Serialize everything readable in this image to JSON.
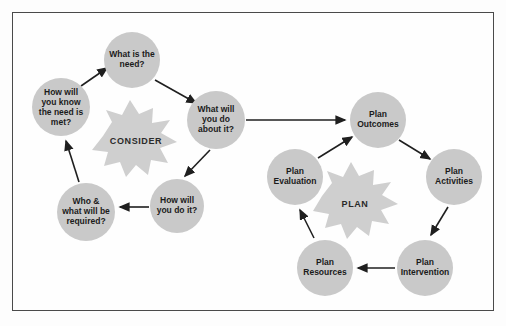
{
  "diagram": {
    "background_color": "#fdfdfd",
    "frame_color": "#4a4a4a",
    "node_fill": "#c9c9c9",
    "burst_fill": "#cfcfcf",
    "arrow_color": "#1f1f1f",
    "text_color": "#1b1b1b"
  },
  "consider_cycle": {
    "burst_label": "CONSIDER",
    "nodes": [
      {
        "id": "what-is-the-need",
        "lines": [
          "What is the",
          "need?"
        ],
        "cx": 132,
        "cy": 60,
        "r": 28
      },
      {
        "id": "what-will-you-do-about-it",
        "lines": [
          "What will",
          "you do",
          "about it?"
        ],
        "cx": 216,
        "cy": 120,
        "r": 29
      },
      {
        "id": "how-will-you-do-it",
        "lines": [
          "How will",
          "you do it?"
        ],
        "cx": 177,
        "cy": 206,
        "r": 27
      },
      {
        "id": "who-and-what-will-be-required",
        "lines": [
          "Who &",
          "what will be",
          "required?"
        ],
        "cx": 86,
        "cy": 212,
        "r": 29
      },
      {
        "id": "how-will-you-know-the-need-is-met",
        "lines": [
          "How will",
          "you know",
          "the need is",
          "met?"
        ],
        "cx": 61,
        "cy": 107,
        "r": 29
      }
    ],
    "arrows": [
      {
        "from": "how-will-you-know-the-need-is-met",
        "to": "what-is-the-need"
      },
      {
        "from": "what-is-the-need",
        "to": "what-will-you-do-about-it"
      },
      {
        "from": "what-will-you-do-about-it",
        "to": "how-will-you-do-it"
      },
      {
        "from": "how-will-you-do-it",
        "to": "who-and-what-will-be-required"
      },
      {
        "from": "who-and-what-will-be-required",
        "to": "how-will-you-know-the-need-is-met"
      }
    ]
  },
  "plan_cycle": {
    "burst_label": "PLAN",
    "nodes": [
      {
        "id": "plan-outcomes",
        "lines": [
          "Plan",
          "Outcomes"
        ],
        "cx": 378,
        "cy": 120,
        "r": 28
      },
      {
        "id": "plan-activities",
        "lines": [
          "Plan",
          "Activities"
        ],
        "cx": 454,
        "cy": 177,
        "r": 28
      },
      {
        "id": "plan-intervention",
        "lines": [
          "Plan",
          "Intervention"
        ],
        "cx": 425,
        "cy": 268,
        "r": 28
      },
      {
        "id": "plan-resources",
        "lines": [
          "Plan",
          "Resources"
        ],
        "cx": 325,
        "cy": 268,
        "r": 28
      },
      {
        "id": "plan-evaluation",
        "lines": [
          "Plan",
          "Evaluation"
        ],
        "cx": 295,
        "cy": 177,
        "r": 28
      }
    ],
    "arrows": [
      {
        "from": "plan-outcomes",
        "to": "plan-activities"
      },
      {
        "from": "plan-activities",
        "to": "plan-intervention"
      },
      {
        "from": "plan-intervention",
        "to": "plan-resources"
      },
      {
        "from": "plan-resources",
        "to": "plan-evaluation"
      },
      {
        "from": "plan-evaluation",
        "to": "plan-outcomes"
      }
    ]
  },
  "connector": {
    "id": "consider-to-plan-connector",
    "from": "what-will-you-do-about-it",
    "to": "plan-outcomes"
  }
}
